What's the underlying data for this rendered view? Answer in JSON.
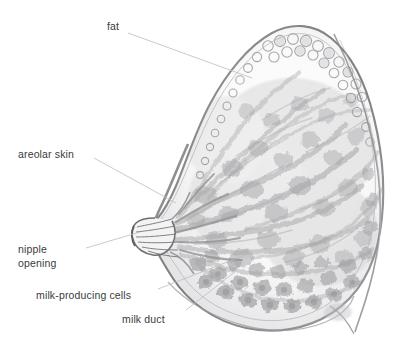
{
  "figure": {
    "background_color": "#ffffff",
    "width": 416,
    "height": 355
  },
  "style": {
    "label_color": "#3b3b3d",
    "leader_color": "#b9b9bb",
    "outline_color": "#6f6f72",
    "skin_color": "#8d8d90",
    "tissue_light": "#d9d9db",
    "tissue_mid": "#b2b2b5",
    "tissue_dark": "#8a8a8d",
    "fat_color": "#c8c8ca",
    "lobule_color": "#9a9a9d"
  },
  "labels": [
    {
      "id": "fat",
      "text": "fat",
      "x": 107,
      "y": 20,
      "leader": {
        "x1": 128,
        "y1": 33,
        "x2": 252,
        "y2": 78
      }
    },
    {
      "id": "areolar-skin",
      "text": "areolar skin",
      "x": 18,
      "y": 148,
      "leader": {
        "x1": 94,
        "y1": 158,
        "x2": 176,
        "y2": 203
      }
    },
    {
      "id": "nipple-opening",
      "text": "nipple\nopening",
      "x": 18,
      "y": 243,
      "leader": {
        "x1": 86,
        "y1": 248,
        "x2": 140,
        "y2": 232
      }
    },
    {
      "id": "milk-producing-cells",
      "text": "milk-producing cells",
      "x": 36,
      "y": 289,
      "leader": {
        "x1": 158,
        "y1": 289,
        "x2": 253,
        "y2": 252
      }
    },
    {
      "id": "milk-duct",
      "text": "milk duct",
      "x": 122,
      "y": 313,
      "leader": {
        "x1": 186,
        "y1": 310,
        "x2": 236,
        "y2": 271
      }
    }
  ],
  "anatomy": {
    "parts": [
      {
        "name": "skin-outline",
        "description": "outer skin boundary of breast in sagittal section"
      },
      {
        "name": "nipple",
        "description": "protruding nipple at left with converging duct openings"
      },
      {
        "name": "areola",
        "description": "areolar skin surrounding nipple base"
      },
      {
        "name": "fat-lobules",
        "description": "bubbly subcutaneous fat along upper border"
      },
      {
        "name": "milk-ducts",
        "description": "branching ductal network radiating toward nipple"
      },
      {
        "name": "milk-producing-cells",
        "description": "alveolar lobule clusters along lower and posterior breast"
      },
      {
        "name": "chest-wall",
        "description": "chest wall line at posterior margin"
      },
      {
        "name": "inframammary-fold",
        "description": "fold where breast meets chest below"
      }
    ]
  }
}
